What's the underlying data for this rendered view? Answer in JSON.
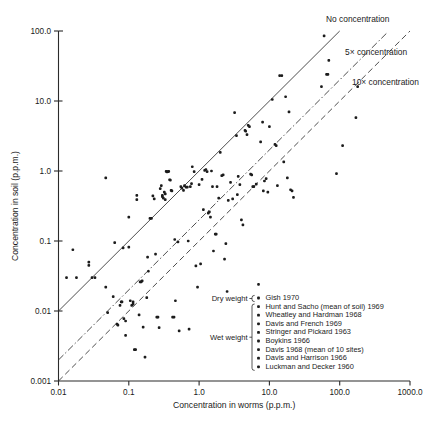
{
  "chart_data": {
    "type": "scatter",
    "title": "",
    "xlabel": "Concentration in worms (p.p.m.)",
    "ylabel": "Concentration in soil (p.p.m.)",
    "xscale": "log",
    "yscale": "log",
    "xlim": [
      0.01,
      1000.0
    ],
    "ylim": [
      0.001,
      100.0
    ],
    "grid": false,
    "xticks": [
      "0.01",
      "0.1",
      "1.0",
      "10.0",
      "100.0",
      "1000.0"
    ],
    "xtick_values": [
      0.01,
      0.1,
      1.0,
      10.0,
      100.0,
      1000.0
    ],
    "yticks": [
      "0.001",
      "0.01",
      "0.1",
      "1.0",
      "10.0",
      "100.0"
    ],
    "ytick_values": [
      0.001,
      0.01,
      0.1,
      1.0,
      10.0,
      100.0
    ],
    "annotations": [
      {
        "text": "No concentration",
        "ratio": 1,
        "style": "solid"
      },
      {
        "text": "5× concentration",
        "ratio": 5,
        "style": "dash-dot"
      },
      {
        "text": "10× concentration",
        "ratio": 10,
        "style": "dashed"
      }
    ],
    "reference_lines": [
      {
        "name": "No concentration",
        "soil_over_worm": 1,
        "style": "solid"
      },
      {
        "name": "5x concentration",
        "soil_over_worm": 0.2,
        "style": "dash-dot"
      },
      {
        "name": "10x concentration",
        "soil_over_worm": 0.1,
        "style": "dashed"
      }
    ],
    "points": [
      [
        0.013,
        0.03
      ],
      [
        0.018,
        0.03
      ],
      [
        0.016,
        0.075
      ],
      [
        0.027,
        0.05
      ],
      [
        0.027,
        0.045
      ],
      [
        0.03,
        0.03
      ],
      [
        0.033,
        0.03
      ],
      [
        0.047,
        0.8
      ],
      [
        0.047,
        0.022
      ],
      [
        0.05,
        0.0095
      ],
      [
        0.06,
        0.016
      ],
      [
        0.063,
        0.095
      ],
      [
        0.068,
        0.0065
      ],
      [
        0.07,
        0.0063
      ],
      [
        0.075,
        0.012
      ],
      [
        0.078,
        0.0135
      ],
      [
        0.08,
        0.0135
      ],
      [
        0.083,
        0.08
      ],
      [
        0.085,
        0.0078
      ],
      [
        0.09,
        0.0072
      ],
      [
        0.09,
        0.0045
      ],
      [
        0.1,
        0.082
      ],
      [
        0.1,
        0.22
      ],
      [
        0.105,
        0.014
      ],
      [
        0.11,
        0.012
      ],
      [
        0.115,
        0.0135
      ],
      [
        0.115,
        0.0125
      ],
      [
        0.12,
        0.0028
      ],
      [
        0.125,
        0.0028
      ],
      [
        0.13,
        0.45
      ],
      [
        0.13,
        0.39
      ],
      [
        0.14,
        0.0088
      ],
      [
        0.145,
        0.026
      ],
      [
        0.15,
        0.026
      ],
      [
        0.155,
        0.027
      ],
      [
        0.16,
        0.0059
      ],
      [
        0.17,
        0.0022
      ],
      [
        0.18,
        0.0155
      ],
      [
        0.185,
        0.059
      ],
      [
        0.19,
        0.037
      ],
      [
        0.2,
        0.21
      ],
      [
        0.21,
        0.21
      ],
      [
        0.22,
        0.44
      ],
      [
        0.23,
        0.4
      ],
      [
        0.24,
        0.065
      ],
      [
        0.25,
        0.0082
      ],
      [
        0.26,
        0.0082
      ],
      [
        0.27,
        0.0058
      ],
      [
        0.28,
        0.56
      ],
      [
        0.29,
        0.62
      ],
      [
        0.3,
        0.43
      ],
      [
        0.3,
        0.45
      ],
      [
        0.31,
        0.41
      ],
      [
        0.32,
        0.5
      ],
      [
        0.33,
        0.47
      ],
      [
        0.33,
        0.39
      ],
      [
        0.34,
        0.99
      ],
      [
        0.35,
        0.97
      ],
      [
        0.36,
        0.98
      ],
      [
        0.37,
        0.99
      ],
      [
        0.38,
        0.75
      ],
      [
        0.39,
        0.74
      ],
      [
        0.4,
        0.53
      ],
      [
        0.41,
        0.52
      ],
      [
        0.42,
        0.0082
      ],
      [
        0.44,
        0.0082
      ],
      [
        0.45,
        0.105
      ],
      [
        0.46,
        0.014
      ],
      [
        0.5,
        0.097
      ],
      [
        0.52,
        0.0052
      ],
      [
        0.55,
        0.6
      ],
      [
        0.57,
        0.57
      ],
      [
        0.6,
        0.53
      ],
      [
        0.62,
        0.62
      ],
      [
        0.65,
        0.59
      ],
      [
        0.68,
        0.59
      ],
      [
        0.7,
        0.1
      ],
      [
        0.72,
        0.0055
      ],
      [
        0.75,
        0.6
      ],
      [
        0.78,
        0.66
      ],
      [
        0.8,
        1.15
      ],
      [
        0.85,
        0.98
      ],
      [
        0.9,
        0.044
      ],
      [
        0.95,
        0.022
      ],
      [
        1.0,
        0.64
      ],
      [
        1.05,
        0.047
      ],
      [
        1.1,
        0.76
      ],
      [
        1.15,
        0.28
      ],
      [
        1.2,
        1.02
      ],
      [
        1.25,
        1.05
      ],
      [
        1.3,
        0.98
      ],
      [
        1.35,
        0.25
      ],
      [
        1.4,
        0.26
      ],
      [
        1.45,
        0.22
      ],
      [
        1.5,
        1.0
      ],
      [
        1.55,
        0.6
      ],
      [
        1.6,
        0.072
      ],
      [
        1.7,
        0.125
      ],
      [
        1.75,
        0.125
      ],
      [
        1.8,
        0.6
      ],
      [
        1.9,
        0.41
      ],
      [
        2.0,
        1.85
      ],
      [
        2.1,
        0.86
      ],
      [
        2.2,
        0.88
      ],
      [
        2.3,
        0.055
      ],
      [
        2.4,
        0.092
      ],
      [
        2.5,
        0.019
      ],
      [
        2.6,
        0.38
      ],
      [
        2.8,
        0.69
      ],
      [
        3.0,
        0.4
      ],
      [
        3.2,
        6.8
      ],
      [
        3.4,
        3.2
      ],
      [
        3.5,
        0.46
      ],
      [
        3.6,
        0.84
      ],
      [
        3.8,
        0.64
      ],
      [
        4.0,
        0.2
      ],
      [
        4.2,
        0.17
      ],
      [
        4.5,
        3.8
      ],
      [
        4.6,
        3.7
      ],
      [
        4.8,
        3.3
      ],
      [
        5.0,
        4.5
      ],
      [
        5.2,
        4.3
      ],
      [
        5.4,
        0.9
      ],
      [
        5.6,
        0.88
      ],
      [
        5.8,
        0.6
      ],
      [
        6.0,
        0.6
      ],
      [
        6.5,
        0.65
      ],
      [
        7.0,
        0.024
      ],
      [
        7.5,
        2.6
      ],
      [
        8.0,
        5.0
      ],
      [
        8.2,
        0.52
      ],
      [
        8.5,
        0.72
      ],
      [
        9.0,
        0.78
      ],
      [
        9.5,
        0.5
      ],
      [
        10.0,
        4.3
      ],
      [
        11.0,
        10.5
      ],
      [
        12.0,
        2.4
      ],
      [
        12.5,
        2.3
      ],
      [
        13.0,
        0.62
      ],
      [
        14.0,
        23
      ],
      [
        15.0,
        23
      ],
      [
        16.0,
        1.35
      ],
      [
        17.0,
        11.5
      ],
      [
        18.0,
        0.8
      ],
      [
        19.0,
        7.0
      ],
      [
        20.0,
        0.54
      ],
      [
        21.0,
        0.52
      ],
      [
        22.0,
        0.42
      ],
      [
        55.0,
        16
      ],
      [
        60.0,
        85
      ],
      [
        65.0,
        24
      ],
      [
        68.0,
        24
      ],
      [
        70.0,
        38
      ],
      [
        90.0,
        0.92
      ],
      [
        110.0,
        2.3
      ],
      [
        170.0,
        5.8
      ],
      [
        180.0,
        16
      ]
    ]
  },
  "legend": {
    "groups": [
      {
        "label": "Dry weight",
        "start_index": 0,
        "end_index": 0
      },
      {
        "label": "Wet weight",
        "start_index": 1,
        "end_index": 8
      }
    ],
    "entries": [
      {
        "marker": "dot",
        "label": "Gish 1970"
      },
      {
        "marker": "dot",
        "label": "Hunt and Sacho (mean of soil) 1969"
      },
      {
        "marker": "dot",
        "label": "Wheatley and Hardman 1968"
      },
      {
        "marker": "dot",
        "label": "Davis and French 1969"
      },
      {
        "marker": "dot",
        "label": "Stringer and Pickard 1963"
      },
      {
        "marker": "dot",
        "label": "Boykins 1966"
      },
      {
        "marker": "dot",
        "label": "Davis 1968 (mean of 10 sites)"
      },
      {
        "marker": "dot",
        "label": "Davis and Harrison 1966"
      },
      {
        "marker": "dot",
        "label": "Luckman and Decker 1960"
      }
    ]
  },
  "colors": {
    "ink": "#1a1a1a",
    "line": "#3a3a3a",
    "background": "#ffffff"
  }
}
